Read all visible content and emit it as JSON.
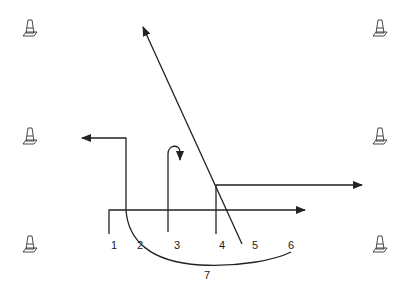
{
  "diagram": {
    "title": "",
    "colors": {
      "line": "#222222",
      "cone": "#333333",
      "background": "#ffffff"
    },
    "cones": [
      {
        "id": "cone-top-left",
        "x": 30,
        "y": 28
      },
      {
        "id": "cone-mid-left",
        "x": 30,
        "y": 136
      },
      {
        "id": "cone-bottom-left",
        "x": 30,
        "y": 244
      },
      {
        "id": "cone-top-right",
        "x": 380,
        "y": 28
      },
      {
        "id": "cone-mid-right",
        "x": 380,
        "y": 136
      },
      {
        "id": "cone-bottom-right",
        "x": 380,
        "y": 244
      }
    ],
    "labels": [
      {
        "text": "1",
        "x": 111,
        "y": 240
      },
      {
        "text": "2",
        "x": 137,
        "y": 240
      },
      {
        "text": "3",
        "x": 174,
        "y": 240
      },
      {
        "text": "4",
        "x": 219,
        "y": 240
      },
      {
        "text": "5",
        "x": 252,
        "y": 240
      },
      {
        "text": "6",
        "x": 288,
        "y": 240
      },
      {
        "text": "7",
        "x": 204,
        "y": 270
      }
    ],
    "routes": [
      {
        "id": "route-1",
        "label": "1",
        "description": "short stem then straight right (flat route)"
      },
      {
        "id": "route-2",
        "label": "2",
        "description": "up then left (out-and-back to the left)"
      },
      {
        "id": "route-3",
        "label": "3",
        "description": "straight up then hook/curl"
      },
      {
        "id": "route-4",
        "label": "4",
        "description": "up then break right (out route)"
      },
      {
        "id": "route-5",
        "label": "5",
        "description": "diagonal up-left (post route)"
      },
      {
        "id": "route-6",
        "label": "6",
        "description": "curved swing route across to the left"
      },
      {
        "id": "route-7",
        "label": "7",
        "description": "wheel curve underneath"
      }
    ]
  }
}
